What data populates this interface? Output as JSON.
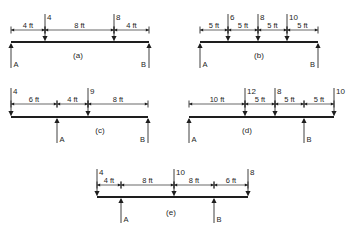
{
  "figure": {
    "background": "#ffffff",
    "ink_color": "#1e1e1e",
    "units": "ft",
    "diagrams": [
      {
        "id": "a",
        "caption": "(a)",
        "beam": {
          "x1": 11,
          "x2": 149,
          "y": 42
        },
        "dim_y": 30,
        "segments": [
          {
            "from": 11,
            "to": 45,
            "label": "4 ft"
          },
          {
            "from": 45,
            "to": 114,
            "label": "8 ft"
          },
          {
            "from": 114,
            "to": 149,
            "label": "4 ft"
          }
        ],
        "loads": [
          {
            "x": 45,
            "value": "4"
          },
          {
            "x": 114,
            "value": "8"
          }
        ],
        "supports": [
          {
            "x": 11,
            "label": "A"
          },
          {
            "x": 149,
            "label": "B"
          }
        ],
        "caption_pos": {
          "x": 78,
          "y": 58
        }
      },
      {
        "id": "b",
        "caption": "(b)",
        "beam": {
          "x1": 200,
          "x2": 318,
          "y": 42
        },
        "dim_y": 30,
        "segments": [
          {
            "from": 200,
            "to": 228,
            "label": "5 ft"
          },
          {
            "from": 228,
            "to": 258,
            "label": "5 ft"
          },
          {
            "from": 258,
            "to": 287,
            "label": "5 ft"
          },
          {
            "from": 287,
            "to": 318,
            "label": "5 ft"
          }
        ],
        "loads": [
          {
            "x": 228,
            "value": "6"
          },
          {
            "x": 258,
            "value": "8"
          },
          {
            "x": 287,
            "value": "10"
          }
        ],
        "supports": [
          {
            "x": 200,
            "label": "A"
          },
          {
            "x": 318,
            "label": "B"
          }
        ],
        "caption_pos": {
          "x": 259,
          "y": 58
        }
      },
      {
        "id": "c",
        "caption": "(c)",
        "beam": {
          "x1": 11,
          "x2": 148,
          "y": 117
        },
        "dim_y": 104,
        "segments": [
          {
            "from": 11,
            "to": 57,
            "label": "6 ft"
          },
          {
            "from": 57,
            "to": 88,
            "label": "4 ft"
          },
          {
            "from": 88,
            "to": 148,
            "label": "8 ft"
          }
        ],
        "loads": [
          {
            "x": 11,
            "value": "4"
          },
          {
            "x": 88,
            "value": "9"
          }
        ],
        "supports": [
          {
            "x": 57,
            "label": "A"
          },
          {
            "x": 148,
            "label": "B"
          }
        ],
        "caption_pos": {
          "x": 100,
          "y": 133
        }
      },
      {
        "id": "d",
        "caption": "(d)",
        "beam": {
          "x1": 189,
          "x2": 334,
          "y": 117
        },
        "dim_y": 104,
        "segments": [
          {
            "from": 189,
            "to": 245,
            "label": "10 ft"
          },
          {
            "from": 245,
            "to": 275,
            "label": "5 ft"
          },
          {
            "from": 275,
            "to": 304,
            "label": "5 ft"
          },
          {
            "from": 304,
            "to": 334,
            "label": "5 ft"
          }
        ],
        "loads": [
          {
            "x": 245,
            "value": "12"
          },
          {
            "x": 275,
            "value": "8"
          },
          {
            "x": 334,
            "value": "10"
          }
        ],
        "supports": [
          {
            "x": 189,
            "label": "A"
          },
          {
            "x": 304,
            "label": "B"
          }
        ],
        "caption_pos": {
          "x": 247,
          "y": 133
        }
      },
      {
        "id": "e",
        "caption": "(e)",
        "beam": {
          "x1": 97,
          "x2": 248,
          "y": 197
        },
        "dim_y": 185,
        "segments": [
          {
            "from": 97,
            "to": 121,
            "label": "4 ft"
          },
          {
            "from": 121,
            "to": 174,
            "label": "8 ft"
          },
          {
            "from": 174,
            "to": 214,
            "label": "8 ft"
          },
          {
            "from": 214,
            "to": 248,
            "label": "6 ft"
          }
        ],
        "loads": [
          {
            "x": 97,
            "value": "4"
          },
          {
            "x": 174,
            "value": "10"
          },
          {
            "x": 248,
            "value": "8"
          }
        ],
        "supports": [
          {
            "x": 121,
            "label": "A"
          },
          {
            "x": 214,
            "label": "B"
          }
        ],
        "caption_pos": {
          "x": 171,
          "y": 215
        }
      }
    ]
  }
}
